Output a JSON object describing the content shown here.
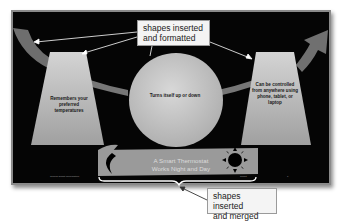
{
  "callouts": {
    "top": {
      "line1": "shapes inserted",
      "line2": "and formatted"
    },
    "bottom": {
      "line1": "shapes inserted",
      "line2": "and merged"
    }
  },
  "slide": {
    "left_shape_text": "Remembers your preferred temperatures",
    "center_shape_text": "Turns itself up or down",
    "right_shape_text": "Can be controlled from anywhere using phone, tablet, or laptop",
    "banner": {
      "line1": "A Smart Thermostat",
      "line2": "Works Night and Day"
    },
    "footer": {
      "left": "Gemini Smart Corporation",
      "right": "Smart",
      "page": "1"
    }
  },
  "colors": {
    "slide_bg": "#050505",
    "shape_fill": "#b8b8b8",
    "arrow_fill": "#6e6e6e",
    "callout_bg": "#f4f4f4"
  }
}
